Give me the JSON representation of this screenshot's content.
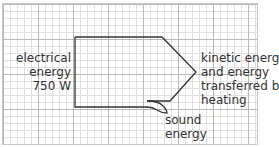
{
  "diagram": {
    "type": "sankey",
    "input": {
      "lines": [
        "electrical",
        "energy",
        "750 W"
      ]
    },
    "outputs": [
      {
        "lines": [
          "kinetic energy",
          "and energy",
          "transferred by",
          "heating"
        ]
      },
      {
        "lines": [
          "sound",
          "energy"
        ]
      }
    ],
    "colors": {
      "outline": "#333333",
      "grid_major": "#b8b8b8",
      "grid_minor": "#e0e0e0",
      "text": "#333333"
    }
  }
}
